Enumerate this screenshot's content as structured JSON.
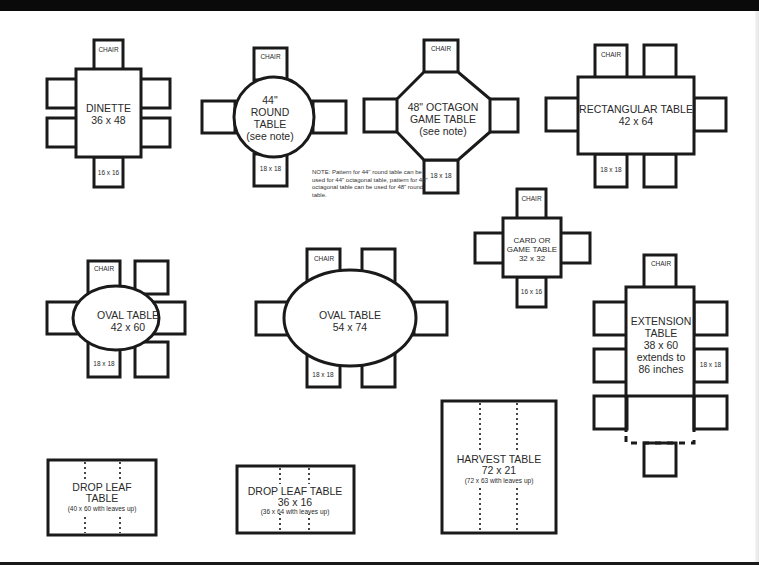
{
  "colors": {
    "line": "#1a1a1a",
    "text": "#2a2a2a",
    "background": "#ffffff",
    "frame": "#0a0a0a"
  },
  "chair_label": "CHAIR",
  "tables": {
    "dinette": {
      "name": "DINETTE",
      "size": "36 x 48",
      "chair_size": "16 x 16",
      "chairs": 6
    },
    "round": {
      "line1": "44\"",
      "line2": "ROUND",
      "line3": "TABLE",
      "line4": "(see note)",
      "chair_size": "18 x 18",
      "chairs": 4
    },
    "octagon": {
      "line1": "48\" OCTAGON",
      "line2": "GAME TABLE",
      "line3": "(see note)",
      "chair_size": "18 x 18",
      "chairs": 4
    },
    "rectangular": {
      "name": "RECTANGULAR TABLE",
      "size": "42 x 64",
      "chair_size": "18 x 18",
      "chairs": 6
    },
    "card": {
      "line1": "CARD OR",
      "line2": "GAME TABLE",
      "size": "32 x 32",
      "chair_size": "16 x 16",
      "chairs": 4
    },
    "oval_small": {
      "name": "OVAL TABLE",
      "size": "42 x 60",
      "chair_size": "18 x 18",
      "chairs": 6
    },
    "oval_large": {
      "name": "OVAL TABLE",
      "size": "54 x 74",
      "chair_size": "18 x 18",
      "chairs": 6
    },
    "extension": {
      "line1": "EXTENSION",
      "line2": "TABLE",
      "line3": "38 x 60",
      "line4": "extends to",
      "line5": "86 inches",
      "chair_size": "18 x 18",
      "chairs": 7
    },
    "drop_leaf_1": {
      "line1": "DROP LEAF",
      "line2": "TABLE",
      "line3": "(40 x 60 with leaves up)"
    },
    "drop_leaf_2": {
      "line1": "DROP LEAF TABLE",
      "line2": "36 x 16",
      "line3": "(36 x 64 with leaves up)"
    },
    "harvest": {
      "line1": "HARVEST TABLE",
      "line2": "72 x 21",
      "line3": "(72 x 63 with leaves up)"
    }
  },
  "note": "NOTE: Pattern for 44\" round table can be used for 44\" octagonal table, pattern for 48\" octagonal table can be used for 48\" round table."
}
